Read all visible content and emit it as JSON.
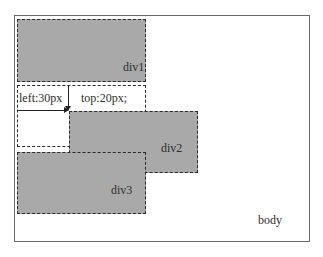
{
  "diagram": {
    "container_label": "body",
    "boxes": [
      {
        "id": "div1",
        "label": "div1",
        "fill": "#a9a9a9"
      },
      {
        "id": "div2",
        "label": "div2",
        "fill": "#a9a9a9",
        "offset_note": "relative, left:30px; top:20px"
      },
      {
        "id": "div3",
        "label": "div3",
        "fill": "#a9a9a9"
      }
    ],
    "annotations": {
      "left_offset": "left:30px",
      "top_offset": "top:20px;"
    }
  }
}
